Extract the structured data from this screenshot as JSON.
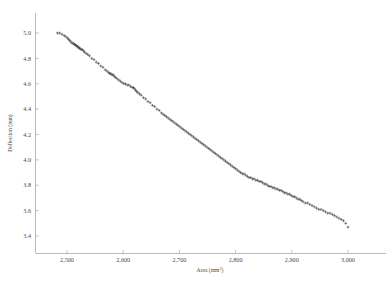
{
  "figure": {
    "name": "deflection-vs-area-scatter",
    "background_color": "#ffffff",
    "axis_color": "#9a9a9a",
    "marker_color": "#2a2a2a",
    "marker_symbol": "+"
  },
  "axes": {
    "x_title_main": "Area (mm",
    "x_title_sup": "2",
    "x_title_close": ")",
    "y_title": "Deflection (mm)",
    "x_ticks": [
      "2,500",
      "2,600",
      "2,700",
      "2,800",
      "2,900",
      "3,000"
    ],
    "x_tick_values": [
      2500,
      2600,
      2700,
      2800,
      2900,
      3000
    ],
    "y_ticks": [
      "3.4",
      "3.6",
      "3.8",
      "4.0",
      "4.2",
      "4.4",
      "4.6",
      "4.8",
      "5.0"
    ],
    "y_tick_values": [
      3.4,
      3.6,
      3.8,
      4.0,
      4.2,
      4.4,
      4.6,
      4.8,
      5.0
    ],
    "xlim": [
      2448,
      3022
    ],
    "ylim": [
      3.3,
      5.06
    ]
  },
  "chart_data": {
    "type": "scatter",
    "title": "",
    "subtitle": "",
    "xlabel": "Area (mm2)",
    "ylabel": "Deflection (mm)",
    "xlim": [
      2448,
      3022
    ],
    "ylim": [
      3.3,
      5.06
    ],
    "grid": false,
    "legend": null,
    "marker": "+",
    "marker_color": "#2a2a2a",
    "series": [
      {
        "name": "specimen",
        "x": [
          2483,
          2487,
          2491,
          2495,
          2498,
          2501,
          2503,
          2505,
          2507,
          2509,
          2511,
          2513,
          2514,
          2516,
          2517,
          2519,
          2520,
          2522,
          2523,
          2525,
          2527,
          2529,
          2531,
          2534,
          2537,
          2540,
          2544,
          2548,
          2552,
          2556,
          2560,
          2564,
          2568,
          2571,
          2574,
          2576,
          2578,
          2580,
          2582,
          2584,
          2586,
          2589,
          2592,
          2595,
          2598,
          2601,
          2604,
          2607,
          2610,
          2613,
          2616,
          2618,
          2620,
          2622,
          2624,
          2626,
          2629,
          2632,
          2636,
          2640,
          2644,
          2648,
          2652,
          2656,
          2660,
          2664,
          2668,
          2671,
          2674,
          2677,
          2680,
          2683,
          2686,
          2689,
          2692,
          2695,
          2698,
          2701,
          2704,
          2707,
          2710,
          2713,
          2716,
          2719,
          2722,
          2725,
          2728,
          2731,
          2734,
          2737,
          2740,
          2743,
          2746,
          2749,
          2752,
          2755,
          2758,
          2761,
          2764,
          2767,
          2770,
          2773,
          2776,
          2779,
          2782,
          2785,
          2788,
          2791,
          2794,
          2797,
          2800,
          2803,
          2806,
          2809,
          2812,
          2815,
          2818,
          2821,
          2824,
          2827,
          2830,
          2833,
          2836,
          2839,
          2842,
          2845,
          2848,
          2851,
          2854,
          2857,
          2860,
          2863,
          2866,
          2869,
          2872,
          2875,
          2878,
          2881,
          2884,
          2887,
          2890,
          2893,
          2896,
          2899,
          2902,
          2905,
          2908,
          2911,
          2914,
          2917,
          2920,
          2924,
          2928,
          2932,
          2936,
          2940,
          2944,
          2948,
          2952,
          2956,
          2960,
          2964,
          2968,
          2972,
          2976,
          2980,
          2984,
          2988,
          2992,
          2996,
          3000
        ],
        "y": [
          5.0,
          5.0,
          4.99,
          4.98,
          4.97,
          4.96,
          4.95,
          4.94,
          4.93,
          4.92,
          4.92,
          4.91,
          4.91,
          4.9,
          4.9,
          4.89,
          4.89,
          4.88,
          4.88,
          4.87,
          4.87,
          4.86,
          4.85,
          4.84,
          4.83,
          4.82,
          4.8,
          4.79,
          4.77,
          4.76,
          4.74,
          4.73,
          4.71,
          4.7,
          4.69,
          4.68,
          4.68,
          4.67,
          4.67,
          4.66,
          4.65,
          4.64,
          4.63,
          4.62,
          4.61,
          4.6,
          4.6,
          4.59,
          4.59,
          4.58,
          4.57,
          4.57,
          4.56,
          4.55,
          4.54,
          4.53,
          4.52,
          4.51,
          4.49,
          4.48,
          4.46,
          4.45,
          4.43,
          4.42,
          4.4,
          4.39,
          4.37,
          4.36,
          4.35,
          4.34,
          4.33,
          4.32,
          4.31,
          4.3,
          4.29,
          4.28,
          4.27,
          4.26,
          4.25,
          4.24,
          4.23,
          4.22,
          4.21,
          4.2,
          4.19,
          4.18,
          4.17,
          4.16,
          4.15,
          4.14,
          4.13,
          4.12,
          4.11,
          4.1,
          4.09,
          4.08,
          4.07,
          4.06,
          4.05,
          4.04,
          4.03,
          4.02,
          4.01,
          4.0,
          3.99,
          3.98,
          3.97,
          3.96,
          3.95,
          3.94,
          3.93,
          3.92,
          3.91,
          3.9,
          3.89,
          3.89,
          3.88,
          3.87,
          3.86,
          3.86,
          3.85,
          3.85,
          3.84,
          3.84,
          3.83,
          3.83,
          3.82,
          3.81,
          3.81,
          3.8,
          3.79,
          3.79,
          3.78,
          3.78,
          3.77,
          3.77,
          3.76,
          3.76,
          3.75,
          3.74,
          3.74,
          3.73,
          3.73,
          3.72,
          3.71,
          3.71,
          3.7,
          3.69,
          3.69,
          3.68,
          3.67,
          3.66,
          3.66,
          3.65,
          3.64,
          3.63,
          3.62,
          3.61,
          3.61,
          3.6,
          3.59,
          3.58,
          3.58,
          3.57,
          3.56,
          3.55,
          3.54,
          3.53,
          3.52,
          3.5,
          3.47
        ]
      }
    ]
  }
}
